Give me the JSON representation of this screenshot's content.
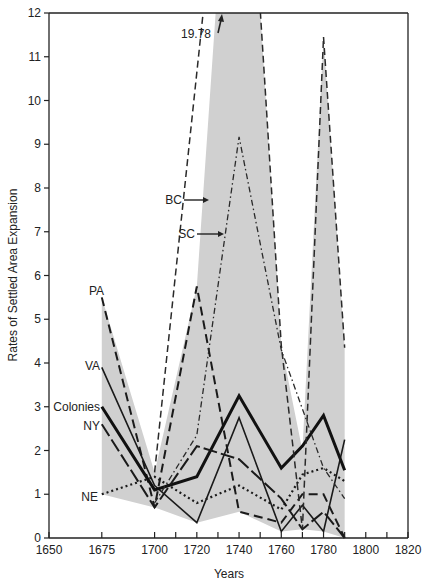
{
  "chart_data": {
    "type": "line",
    "title": "",
    "xlabel": "Years",
    "ylabel": "Rates of Settled Area Expansion",
    "xlim": [
      1650,
      1820
    ],
    "ylim": [
      0,
      12
    ],
    "x_ticks": [
      1650,
      1675,
      1700,
      1720,
      1740,
      1760,
      1780,
      1800,
      1820
    ],
    "x_minor_ticks": [
      1710,
      1730,
      1750,
      1770,
      1790,
      1810
    ],
    "y_ticks": [
      0,
      1,
      2,
      3,
      4,
      5,
      6,
      7,
      8,
      9,
      10,
      11,
      12
    ],
    "grid": false,
    "legend": "inline labels",
    "band": {
      "description": "shaded range between min and max of colonies",
      "color": "#d0d0d0",
      "upper": {
        "x": [
          1675,
          1700,
          1720,
          1740,
          1760,
          1770,
          1780,
          1790
        ],
        "y": [
          5.5,
          1.5,
          5.75,
          19.78,
          4.4,
          2.0,
          11.45,
          4.35
        ]
      },
      "lower": {
        "x": [
          1675,
          1700,
          1720,
          1740,
          1760,
          1770,
          1780,
          1790
        ],
        "y": [
          1.0,
          0.7,
          0.35,
          0.6,
          0.15,
          0.2,
          0.15,
          0.0
        ]
      }
    },
    "series": [
      {
        "name": "PA",
        "style": "dash-heavy",
        "x": [
          1675,
          1700,
          1720,
          1740,
          1760,
          1770,
          1780,
          1790
        ],
        "values": [
          5.5,
          0.7,
          5.75,
          0.6,
          0.35,
          1.0,
          1.0,
          0.0
        ]
      },
      {
        "name": "VA",
        "style": "solid-thin",
        "x": [
          1675,
          1700,
          1720,
          1740,
          1760,
          1770,
          1780,
          1790
        ],
        "values": [
          3.9,
          1.2,
          0.35,
          2.75,
          0.15,
          0.75,
          0.15,
          2.25
        ]
      },
      {
        "name": "Colonies",
        "style": "solid-thick",
        "x": [
          1675,
          1700,
          1720,
          1740,
          1760,
          1770,
          1780,
          1790
        ],
        "values": [
          3.0,
          1.1,
          1.4,
          3.25,
          1.6,
          2.1,
          2.8,
          1.55
        ]
      },
      {
        "name": "NY",
        "style": "long-dash",
        "x": [
          1675,
          1700,
          1720,
          1740,
          1760,
          1770,
          1780,
          1790
        ],
        "values": [
          2.6,
          0.7,
          2.1,
          1.8,
          0.9,
          0.2,
          0.6,
          0.0
        ]
      },
      {
        "name": "NE",
        "style": "dotted",
        "x": [
          1675,
          1700,
          1720,
          1740,
          1760,
          1770,
          1780,
          1790
        ],
        "values": [
          1.0,
          1.4,
          0.8,
          1.2,
          0.65,
          1.45,
          1.6,
          1.3
        ]
      },
      {
        "name": "BC",
        "style": "dashed",
        "x": [
          1700,
          1740,
          1760,
          1770,
          1780,
          1790
        ],
        "values": [
          1.5,
          19.78,
          4.4,
          0.2,
          11.45,
          4.35
        ]
      },
      {
        "name": "SC",
        "style": "dash-dot",
        "x": [
          1700,
          1720,
          1740,
          1760,
          1780,
          1790
        ],
        "values": [
          0.8,
          2.35,
          9.17,
          4.3,
          1.6,
          0.9
        ]
      }
    ],
    "annotations": [
      {
        "text": "19.78",
        "note": "BC value at 1740 exceeds axis max (arrow pointing up)"
      },
      {
        "text": "BC",
        "arrow": true
      },
      {
        "text": "SC",
        "arrow": true
      }
    ]
  },
  "labels": {
    "xlabel": "Years",
    "ylabel": "Rates of Settled Area Expansion",
    "offscale": "19.78",
    "PA": "PA",
    "VA": "VA",
    "Colonies": "Colonies",
    "NY": "NY",
    "NE": "NE",
    "BC": "BC",
    "SC": "SC"
  }
}
